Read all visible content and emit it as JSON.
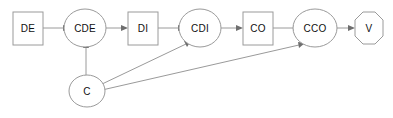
{
  "diagram": {
    "type": "directed-graph",
    "background_color": "#ffffff",
    "node_fill": "#ffffff",
    "node_stroke": "#9a9a9a",
    "edge_color": "#9a9a9a",
    "arrowhead_color": "#6e6e6e",
    "label_color": "#101010",
    "nodes": [
      {
        "id": "DE",
        "label": "DE",
        "shape": "rectangle",
        "cx": 28,
        "cy": 28
      },
      {
        "id": "CDE",
        "label": "CDE",
        "shape": "ellipse",
        "cx": 85,
        "cy": 28
      },
      {
        "id": "DI",
        "label": "DI",
        "shape": "rectangle",
        "cx": 143,
        "cy": 28
      },
      {
        "id": "CDI",
        "label": "CDI",
        "shape": "ellipse",
        "cx": 200,
        "cy": 28
      },
      {
        "id": "CO",
        "label": "CO",
        "shape": "rectangle",
        "cx": 258,
        "cy": 28
      },
      {
        "id": "CCO",
        "label": "CCO",
        "shape": "ellipse",
        "cx": 315,
        "cy": 28
      },
      {
        "id": "V",
        "label": "V",
        "shape": "octagon",
        "cx": 369,
        "cy": 28
      },
      {
        "id": "C",
        "label": "C",
        "shape": "ellipse",
        "cx": 87,
        "cy": 91
      }
    ],
    "edges": [
      {
        "from": "DE",
        "to": "CDE",
        "directed": true
      },
      {
        "from": "CDE",
        "to": "DI",
        "directed": true
      },
      {
        "from": "DI",
        "to": "CDI",
        "directed": true
      },
      {
        "from": "CDI",
        "to": "CO",
        "directed": true
      },
      {
        "from": "CO",
        "to": "CCO",
        "directed": true
      },
      {
        "from": "CCO",
        "to": "V",
        "directed": true
      },
      {
        "from": "C",
        "to": "CDE",
        "directed": true
      },
      {
        "from": "C",
        "to": "CDI",
        "directed": true
      },
      {
        "from": "C",
        "to": "CCO",
        "directed": true
      }
    ]
  }
}
